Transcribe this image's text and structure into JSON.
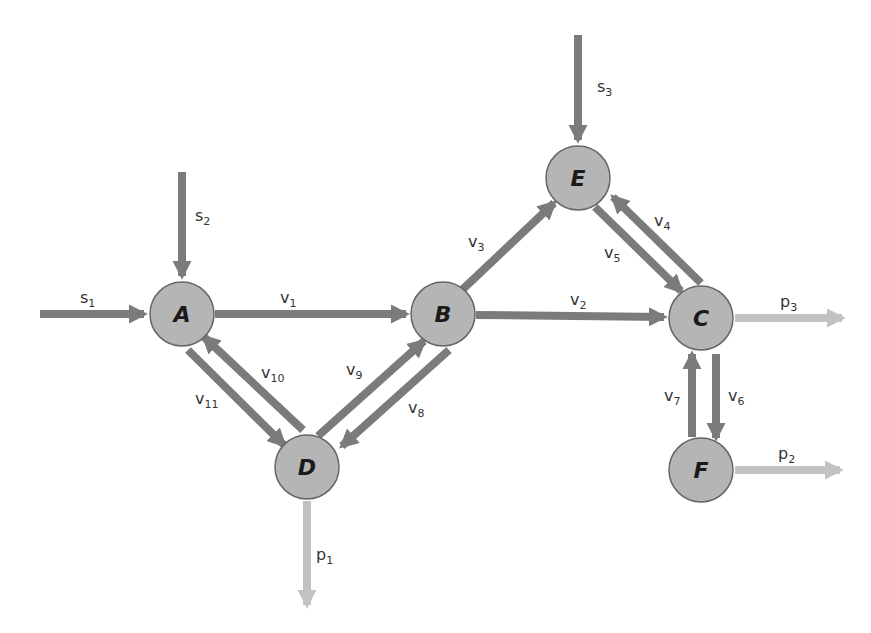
{
  "diagram": {
    "colors": {
      "node_fill": "#b5b5b5",
      "node_stroke": "#666666",
      "internal_flux": "#7b7b7b",
      "input_flux": "#7b7b7b",
      "output_flux": "#c2c2c2",
      "label": "#333333"
    },
    "nodes": [
      {
        "id": "A",
        "label": "A",
        "x": 182,
        "y": 314
      },
      {
        "id": "B",
        "label": "B",
        "x": 443,
        "y": 314
      },
      {
        "id": "C",
        "label": "C",
        "x": 701,
        "y": 318
      },
      {
        "id": "D",
        "label": "D",
        "x": 307,
        "y": 467
      },
      {
        "id": "E",
        "label": "E",
        "x": 578,
        "y": 178
      },
      {
        "id": "F",
        "label": "F",
        "x": 701,
        "y": 470
      }
    ],
    "inputs": [
      {
        "id": "s1",
        "base": "s",
        "sub": "1",
        "to": "A"
      },
      {
        "id": "s2",
        "base": "s",
        "sub": "2",
        "to": "A"
      },
      {
        "id": "s3",
        "base": "s",
        "sub": "3",
        "to": "E"
      }
    ],
    "outputs": [
      {
        "id": "p1",
        "base": "p",
        "sub": "1",
        "from": "D"
      },
      {
        "id": "p2",
        "base": "p",
        "sub": "2",
        "from": "F"
      },
      {
        "id": "p3",
        "base": "p",
        "sub": "3",
        "from": "C"
      }
    ],
    "edges": [
      {
        "id": "v1",
        "base": "v",
        "sub": "1",
        "from": "A",
        "to": "B"
      },
      {
        "id": "v2",
        "base": "v",
        "sub": "2",
        "from": "B",
        "to": "C"
      },
      {
        "id": "v3",
        "base": "v",
        "sub": "3",
        "from": "B",
        "to": "E"
      },
      {
        "id": "v4",
        "base": "v",
        "sub": "4",
        "from": "C",
        "to": "E"
      },
      {
        "id": "v5",
        "base": "v",
        "sub": "5",
        "from": "E",
        "to": "C"
      },
      {
        "id": "v6",
        "base": "v",
        "sub": "6",
        "from": "C",
        "to": "F"
      },
      {
        "id": "v7",
        "base": "v",
        "sub": "7",
        "from": "F",
        "to": "C"
      },
      {
        "id": "v8",
        "base": "v",
        "sub": "8",
        "from": "B",
        "to": "D"
      },
      {
        "id": "v9",
        "base": "v",
        "sub": "9",
        "from": "D",
        "to": "B"
      },
      {
        "id": "v10",
        "base": "v",
        "sub": "10",
        "from": "D",
        "to": "A"
      },
      {
        "id": "v11",
        "base": "v",
        "sub": "11",
        "from": "A",
        "to": "D"
      }
    ]
  }
}
